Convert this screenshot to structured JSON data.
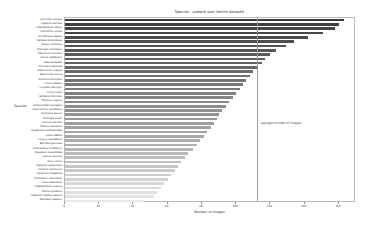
{
  "chart_data": {
    "type": "bar",
    "orientation": "horizontal",
    "title": "Species - sample size (entire dataset)",
    "xlabel": "Number of images",
    "ylabel": "Species",
    "xlim": [
      0,
      170
    ],
    "ylim": null,
    "grid": false,
    "legend": null,
    "xticks": [
      0,
      20,
      40,
      60,
      80,
      100,
      120,
      140,
      160
    ],
    "xticklabels": [
      "0",
      "20",
      "40",
      "60",
      "80",
      "100",
      "120",
      "140",
      "160"
    ],
    "annotations": [
      {
        "text": "average number of images",
        "x": 112,
        "type": "vline-label"
      }
    ],
    "reference_line": {
      "value": 112,
      "label": "average number of images",
      "color": "#9a9a9a"
    },
    "colormap": "grey-gradient-dark-to-light",
    "categories": [
      "Dittrichia viscosa",
      "Capparis spinosa",
      "Chenopodium album",
      "Chondrilla juncea",
      "Arundinaria repens",
      "Verbena bonariensis",
      "Rubus ulmifolius",
      "Plantago coronopus",
      "Tiburcium fruticans",
      "Salvia verbenaca",
      "Olea europaea",
      "Portulaca oleracea",
      "Foeniculum vulgare",
      "Mercurialis annua",
      "Sonchus oleraceus",
      "Cistus albidus",
      "Cynodon dactylon",
      "Urtica urens",
      "Verbena officinalis",
      "Thymus vulgaris",
      "Alternanthera pungens",
      "Amaranthus retroflexus",
      "Nicotiana glauca",
      "Plantago major",
      "Lactuca serriola",
      "Tribulus terrestris",
      "Dysphania ambrosioides",
      "Oxalis debilis",
      "Conyza canadensis",
      "Borrelia glutinosa",
      "Amaranthus viridiflorus",
      "Paspalum paspalodes",
      "Galium aparine",
      "Ficus carica",
      "Digitaria sanguinalis",
      "Silybum marianum",
      "Sorghum halepense",
      "Trachelium caeruleum",
      "Cissus boetidula",
      "Chenopodium suecica",
      "Malva sylvestris",
      "Aldernet capillus-veneris",
      "Tabacella repellus"
    ],
    "values": [
      163,
      160,
      158,
      151,
      142,
      134,
      129,
      123,
      120,
      117,
      115,
      112,
      110,
      108,
      106,
      104,
      102,
      100,
      98,
      96,
      94,
      92,
      90,
      89,
      87,
      85,
      83,
      81,
      79,
      77,
      75,
      72,
      70,
      68,
      66,
      64,
      62,
      60,
      58,
      56,
      54,
      52,
      46
    ]
  }
}
